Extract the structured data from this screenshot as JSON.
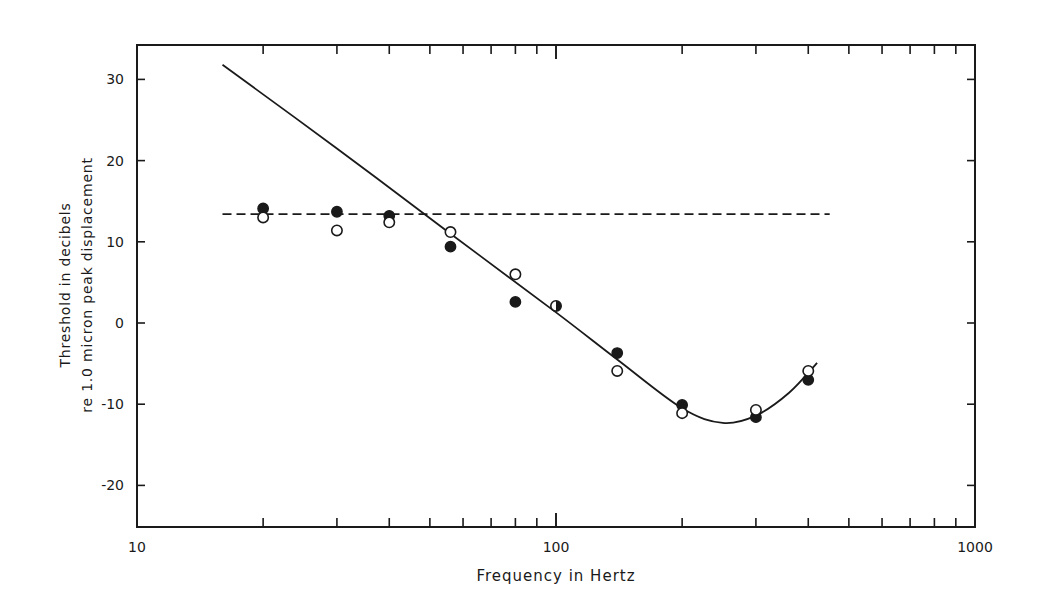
{
  "chart_data": {
    "type": "scatter",
    "title": "",
    "xlabel": "Frequency in Hertz",
    "ylabel_lines": [
      "Threshold in decibels",
      "re 1.0 micron peak displacement"
    ],
    "xscale": "log",
    "xlim": [
      10,
      1000
    ],
    "ylim": [
      -25,
      34
    ],
    "x_tick_labels": [
      "10",
      "100",
      "1000"
    ],
    "x_ticks": [
      10,
      100,
      1000
    ],
    "y_ticks": [
      -20,
      -10,
      0,
      10,
      20,
      30
    ],
    "y_tick_labels": [
      "-20",
      "-10",
      "0",
      "10",
      "20",
      "30"
    ],
    "grid": false,
    "legend": null,
    "series": [
      {
        "name": "filled circles",
        "marker": "filled-circle",
        "x": [
          20,
          30,
          40,
          56,
          80,
          140,
          200,
          300,
          400
        ],
        "y": [
          14.1,
          13.7,
          13.2,
          9.4,
          2.6,
          -3.7,
          -10.1,
          -11.6,
          -7.0
        ]
      },
      {
        "name": "open circles",
        "marker": "open-circle",
        "x": [
          20,
          30,
          40,
          56,
          80,
          140,
          200,
          300,
          400
        ],
        "y": [
          13.0,
          11.4,
          12.4,
          11.2,
          6.0,
          -5.9,
          -11.1,
          -10.7,
          -5.9
        ]
      },
      {
        "name": "half-filled circle (coincident)",
        "marker": "half-filled-circle",
        "x": [
          100
        ],
        "y": [
          2.1
        ]
      }
    ],
    "lines": [
      {
        "name": "solid fitted curve",
        "style": "solid",
        "x": [
          16,
          30,
          56,
          100,
          140,
          200,
          250,
          300,
          360,
          420
        ],
        "y": [
          31.8,
          21.5,
          11.0,
          1.3,
          -4.5,
          -10.5,
          -12.3,
          -11.4,
          -8.6,
          -4.9
        ]
      },
      {
        "name": "dashed reference",
        "style": "dashed",
        "x": [
          16,
          450
        ],
        "y": [
          13.4,
          13.4
        ]
      }
    ]
  }
}
